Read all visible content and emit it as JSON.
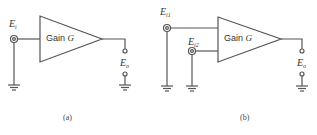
{
  "figure": {
    "colors": {
      "line": "#555555",
      "text": "#333333",
      "background": "#ffffff"
    },
    "panels": [
      {
        "id": "a",
        "caption": "(a)",
        "amplifier_label_prefix": "Gain ",
        "amplifier_label_var": "G",
        "inputs": [
          {
            "label_main": "E",
            "label_sub": "i"
          }
        ],
        "output": {
          "label_main": "E",
          "label_sub": "o"
        }
      },
      {
        "id": "b",
        "caption": "(b)",
        "amplifier_label_prefix": "Gain ",
        "amplifier_label_var": "G",
        "inputs": [
          {
            "label_main": "E",
            "label_sub": "i1"
          },
          {
            "label_main": "E",
            "label_sub": "i2"
          }
        ],
        "output": {
          "label_main": "E",
          "label_sub": "o"
        }
      }
    ]
  }
}
